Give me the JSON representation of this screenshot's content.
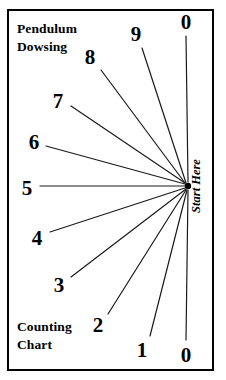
{
  "chart_data": {
    "type": "scatter",
    "title": "Pendulum Dowsing Counting Chart",
    "subtitle": "",
    "xlabel": "",
    "ylabel": "",
    "legend_position": "none",
    "grid": false,
    "hub": {
      "x": 188,
      "y": 186,
      "label": "Start Here"
    },
    "categories": [
      "0",
      "1",
      "2",
      "3",
      "4",
      "5",
      "6",
      "7",
      "8",
      "9",
      "0"
    ],
    "values": [
      0,
      1,
      2,
      3,
      4,
      5,
      6,
      7,
      8,
      9,
      0
    ],
    "series": [
      {
        "name": "rays",
        "points": [
          {
            "label": "0",
            "angle_deg": 90,
            "label_x": 186,
            "label_y": 22,
            "line_x1": 186,
            "line_y1": 36,
            "line_x2": 188,
            "line_y2": 182
          },
          {
            "label": "9",
            "angle_deg": 66,
            "label_x": 136,
            "label_y": 34,
            "line_x1": 142,
            "line_y1": 48,
            "line_x2": 186,
            "line_y2": 183
          },
          {
            "label": "8",
            "angle_deg": 50,
            "label_x": 90,
            "label_y": 57,
            "line_x1": 101,
            "line_y1": 70,
            "line_x2": 185,
            "line_y2": 183
          },
          {
            "label": "7",
            "angle_deg": 33,
            "label_x": 58,
            "label_y": 101,
            "line_x1": 71,
            "line_y1": 106,
            "line_x2": 185,
            "line_y2": 183
          },
          {
            "label": "6",
            "angle_deg": 16,
            "label_x": 34,
            "label_y": 142,
            "line_x1": 46,
            "line_y1": 146,
            "line_x2": 185,
            "line_y2": 184
          },
          {
            "label": "5",
            "angle_deg": 0,
            "label_x": 27,
            "label_y": 188,
            "line_x1": 40,
            "line_y1": 186,
            "line_x2": 185,
            "line_y2": 186
          },
          {
            "label": "4",
            "angle_deg": -16,
            "label_x": 37,
            "label_y": 238,
            "line_x1": 50,
            "line_y1": 232,
            "line_x2": 185,
            "line_y2": 188
          },
          {
            "label": "3",
            "angle_deg": -32,
            "label_x": 59,
            "label_y": 285,
            "line_x1": 71,
            "line_y1": 277,
            "line_x2": 186,
            "line_y2": 189
          },
          {
            "label": "2",
            "angle_deg": -50,
            "label_x": 98,
            "label_y": 325,
            "line_x1": 108,
            "line_y1": 314,
            "line_x2": 186,
            "line_y2": 190
          },
          {
            "label": "1",
            "angle_deg": -66,
            "label_x": 142,
            "label_y": 350,
            "line_x1": 150,
            "line_y1": 336,
            "line_x2": 187,
            "line_y2": 190
          },
          {
            "label": "0",
            "angle_deg": -90,
            "label_x": 186,
            "label_y": 355,
            "line_x1": 186,
            "line_y1": 340,
            "line_x2": 188,
            "line_y2": 190
          }
        ]
      }
    ],
    "annotations": [
      {
        "name": "title-top",
        "line1": "Pendulum",
        "line2": "Dowsing"
      },
      {
        "name": "title-bottom",
        "line1": "Counting",
        "line2": "Chart"
      },
      {
        "name": "hub-label",
        "text": "Start Here"
      }
    ],
    "colors": {
      "ink": "#000000",
      "line": "#1a1a1a",
      "background": "#ffffff"
    }
  },
  "frame": {
    "x": 8,
    "y": 10,
    "width": 205,
    "height": 360
  }
}
